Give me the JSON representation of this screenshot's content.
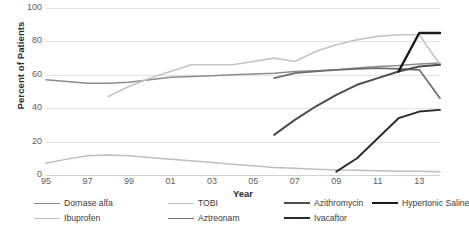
{
  "chart_data": {
    "type": "line",
    "title": "",
    "xlabel": "Year",
    "ylabel": "Percent of Patients",
    "xlim": [
      1995,
      2014
    ],
    "ylim": [
      0,
      100
    ],
    "ytick_values": [
      0,
      20,
      40,
      60,
      80,
      100
    ],
    "ytick_labels": [
      "0",
      "20",
      "40",
      "60",
      "80",
      "100"
    ],
    "xtick_values": [
      1995,
      1997,
      1999,
      2001,
      2003,
      2005,
      2007,
      2009,
      2011,
      2013
    ],
    "xtick_labels": [
      "95",
      "97",
      "99",
      "01",
      "03",
      "05",
      "07",
      "09",
      "11",
      "13"
    ],
    "grid": "horizontal",
    "legend_position": "bottom",
    "series": [
      {
        "name": "Dornase alfa",
        "color": "#8c8c8c",
        "width": 1.5,
        "x": [
          1995,
          1996,
          1997,
          1998,
          1999,
          2000,
          2001,
          2002,
          2003,
          2004,
          2005,
          2006,
          2007,
          2008,
          2009,
          2010,
          2011,
          2012,
          2013,
          2014
        ],
        "y": [
          57,
          56,
          55,
          55,
          55.5,
          57,
          58.5,
          59,
          59.5,
          60,
          60.5,
          61,
          62,
          62.5,
          63,
          64,
          65,
          65.5,
          66.5,
          67
        ]
      },
      {
        "name": "TOBI",
        "color": "#c4c4c4",
        "width": 1.6,
        "x": [
          1998,
          1999,
          2000,
          2001,
          2002,
          2003,
          2004,
          2005,
          2006,
          2007,
          2008,
          2009,
          2010,
          2011,
          2012,
          2013,
          2014
        ],
        "y": [
          47,
          53,
          58,
          62,
          66,
          66,
          66,
          68,
          70,
          68,
          74,
          78,
          81,
          83,
          84,
          84,
          66
        ]
      },
      {
        "name": "Ibuprofen",
        "color": "#bdbdbd",
        "width": 1.5,
        "x": [
          1995,
          1996,
          1997,
          1998,
          1999,
          2000,
          2001,
          2002,
          2003,
          2004,
          2005,
          2006,
          2007,
          2008,
          2009,
          2010,
          2011,
          2012,
          2013,
          2014
        ],
        "y": [
          7,
          9.5,
          11.5,
          12,
          11.5,
          10.5,
          9.5,
          8.5,
          7.5,
          6.5,
          5.5,
          4.5,
          4,
          3.5,
          3,
          2.8,
          2.5,
          2.3,
          2.2,
          2
        ]
      },
      {
        "name": "Aztreonam",
        "color": "#6e6e6e",
        "width": 1.7,
        "x": [
          2006,
          2007,
          2008,
          2009,
          2010,
          2011,
          2012,
          2013,
          2014
        ],
        "y": [
          58,
          61,
          62,
          63,
          63.5,
          64,
          63.5,
          63,
          46
        ]
      },
      {
        "name": "Azithromycin",
        "color": "#4d4d4d",
        "width": 2.0,
        "x": [
          2006,
          2007,
          2008,
          2009,
          2010,
          2011,
          2012,
          2013,
          2014
        ],
        "y": [
          24,
          33,
          41,
          48,
          54,
          58,
          62,
          65,
          66
        ]
      },
      {
        "name": "Hypertonic Saline",
        "color": "#1a1a1a",
        "width": 2.4,
        "x": [
          2012,
          2013,
          2014
        ],
        "y": [
          62,
          85,
          85
        ]
      },
      {
        "name": "Ivacaftor",
        "color": "#2b2b2b",
        "width": 1.9,
        "x": [
          2009,
          2010,
          2011,
          2012,
          2013,
          2014
        ],
        "y": [
          2,
          10,
          22,
          34,
          38,
          39
        ]
      }
    ]
  },
  "legend": {
    "items": [
      {
        "label": "Dornase alfa",
        "color": "#8c8c8c",
        "width": 1.6
      },
      {
        "label": "TOBI",
        "color": "#c4c4c4",
        "width": 1.8
      },
      {
        "label": "Azithromycin",
        "color": "#4d4d4d",
        "width": 2.2
      },
      {
        "label": "Hypertonic Saline",
        "color": "#1a1a1a",
        "width": 2.6
      },
      {
        "label": "Ibuprofen",
        "color": "#bdbdbd",
        "width": 1.6
      },
      {
        "label": "Aztreonam",
        "color": "#6e6e6e",
        "width": 1.9
      },
      {
        "label": "Ivacaftor",
        "color": "#2b2b2b",
        "width": 2.1
      }
    ]
  }
}
